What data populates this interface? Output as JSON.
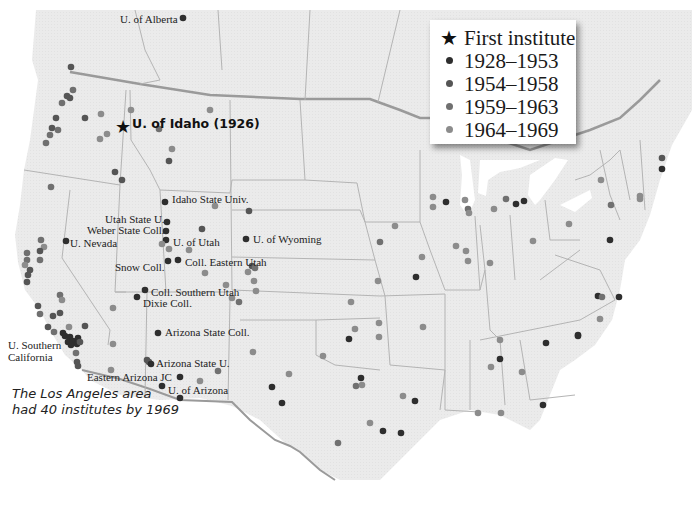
{
  "legend": {
    "items": [
      {
        "symbol": "star-icon",
        "label": "First institute",
        "color": "#111111"
      },
      {
        "symbol": "dot",
        "label": "1928–1953",
        "color": "#2e2e2e"
      },
      {
        "symbol": "dot",
        "label": "1954–1958",
        "color": "#555555"
      },
      {
        "symbol": "dot",
        "label": "1959–1963",
        "color": "#707070"
      },
      {
        "symbol": "dot",
        "label": "1964–1969",
        "color": "#8c8c8c"
      }
    ]
  },
  "first_institute": {
    "label": "U. of Idaho (1926)",
    "x": 122,
    "y": 127
  },
  "annotation": {
    "line1": "The Los Angeles area",
    "line2": "had 40 institutes by 1969"
  },
  "labels": [
    {
      "text": "U. of Alberta",
      "x": 120,
      "y": 13
    },
    {
      "text": "Idaho State Univ.",
      "x": 172,
      "y": 193
    },
    {
      "text": "Utah State U.",
      "x": 105,
      "y": 213
    },
    {
      "text": "Weber State Coll.",
      "x": 87,
      "y": 224
    },
    {
      "text": "U. of Utah",
      "x": 173,
      "y": 236
    },
    {
      "text": "U. Nevada",
      "x": 70,
      "y": 237
    },
    {
      "text": "U. of Wyoming",
      "x": 253,
      "y": 233
    },
    {
      "text": "Coll. Eastern Utah",
      "x": 185,
      "y": 256
    },
    {
      "text": "Snow Coll.",
      "x": 115,
      "y": 261
    },
    {
      "text": "Coll. Southern Utah",
      "x": 151,
      "y": 286
    },
    {
      "text": "Dixie Coll.",
      "x": 143,
      "y": 297
    },
    {
      "text": "Arizona State Coll.",
      "x": 165,
      "y": 326
    },
    {
      "text": "U. Southern",
      "x": 8,
      "y": 339
    },
    {
      "text": "California",
      "x": 8,
      "y": 351
    },
    {
      "text": "Arizona State U.",
      "x": 156,
      "y": 357
    },
    {
      "text": "Eastern Arizona JC",
      "x": 87,
      "y": 371
    },
    {
      "text": "U. of Arizona",
      "x": 168,
      "y": 384
    }
  ],
  "dots": [
    {
      "x": 183,
      "y": 18,
      "p": 1
    },
    {
      "x": 71,
      "y": 67,
      "p": 2
    },
    {
      "x": 73,
      "y": 90,
      "p": 3
    },
    {
      "x": 67,
      "y": 96,
      "p": 2
    },
    {
      "x": 70,
      "y": 98,
      "p": 2
    },
    {
      "x": 62,
      "y": 103,
      "p": 3
    },
    {
      "x": 56,
      "y": 118,
      "p": 2
    },
    {
      "x": 52,
      "y": 128,
      "p": 2
    },
    {
      "x": 58,
      "y": 130,
      "p": 3
    },
    {
      "x": 50,
      "y": 135,
      "p": 3
    },
    {
      "x": 46,
      "y": 143,
      "p": 3
    },
    {
      "x": 85,
      "y": 118,
      "p": 2
    },
    {
      "x": 101,
      "y": 114,
      "p": 4
    },
    {
      "x": 100,
      "y": 139,
      "p": 4
    },
    {
      "x": 107,
      "y": 134,
      "p": 4
    },
    {
      "x": 131,
      "y": 110,
      "p": 4
    },
    {
      "x": 159,
      "y": 129,
      "p": 3
    },
    {
      "x": 210,
      "y": 110,
      "p": 4
    },
    {
      "x": 172,
      "y": 149,
      "p": 4
    },
    {
      "x": 169,
      "y": 161,
      "p": 2
    },
    {
      "x": 115,
      "y": 172,
      "p": 2
    },
    {
      "x": 122,
      "y": 180,
      "p": 2
    },
    {
      "x": 51,
      "y": 187,
      "p": 3
    },
    {
      "x": 165,
      "y": 202,
      "p": 1
    },
    {
      "x": 215,
      "y": 206,
      "p": 4
    },
    {
      "x": 249,
      "y": 211,
      "p": 2
    },
    {
      "x": 167,
      "y": 222,
      "p": 1
    },
    {
      "x": 166,
      "y": 231,
      "p": 1
    },
    {
      "x": 166,
      "y": 240,
      "p": 1
    },
    {
      "x": 202,
      "y": 229,
      "p": 2
    },
    {
      "x": 169,
      "y": 249,
      "p": 4
    },
    {
      "x": 189,
      "y": 250,
      "p": 4
    },
    {
      "x": 246,
      "y": 239,
      "p": 1
    },
    {
      "x": 162,
      "y": 244,
      "p": 4
    },
    {
      "x": 66,
      "y": 241,
      "p": 1
    },
    {
      "x": 41,
      "y": 240,
      "p": 3
    },
    {
      "x": 44,
      "y": 247,
      "p": 4
    },
    {
      "x": 40,
      "y": 251,
      "p": 2
    },
    {
      "x": 27,
      "y": 253,
      "p": 3
    },
    {
      "x": 27,
      "y": 260,
      "p": 3
    },
    {
      "x": 25,
      "y": 265,
      "p": 4
    },
    {
      "x": 30,
      "y": 270,
      "p": 2
    },
    {
      "x": 28,
      "y": 275,
      "p": 2
    },
    {
      "x": 27,
      "y": 282,
      "p": 2
    },
    {
      "x": 40,
      "y": 260,
      "p": 3
    },
    {
      "x": 168,
      "y": 261,
      "p": 1
    },
    {
      "x": 178,
      "y": 260,
      "p": 1
    },
    {
      "x": 252,
      "y": 266,
      "p": 2
    },
    {
      "x": 255,
      "y": 268,
      "p": 3
    },
    {
      "x": 248,
      "y": 272,
      "p": 4
    },
    {
      "x": 205,
      "y": 273,
      "p": 4
    },
    {
      "x": 226,
      "y": 285,
      "p": 4
    },
    {
      "x": 254,
      "y": 281,
      "p": 4
    },
    {
      "x": 256,
      "y": 291,
      "p": 4
    },
    {
      "x": 232,
      "y": 298,
      "p": 4
    },
    {
      "x": 239,
      "y": 302,
      "p": 3
    },
    {
      "x": 145,
      "y": 290,
      "p": 1
    },
    {
      "x": 137,
      "y": 297,
      "p": 1
    },
    {
      "x": 113,
      "y": 308,
      "p": 4
    },
    {
      "x": 60,
      "y": 295,
      "p": 3
    },
    {
      "x": 62,
      "y": 300,
      "p": 4
    },
    {
      "x": 38,
      "y": 306,
      "p": 2
    },
    {
      "x": 40,
      "y": 314,
      "p": 3
    },
    {
      "x": 53,
      "y": 316,
      "p": 2
    },
    {
      "x": 60,
      "y": 313,
      "p": 2
    },
    {
      "x": 48,
      "y": 327,
      "p": 2
    },
    {
      "x": 54,
      "y": 332,
      "p": 3
    },
    {
      "x": 69,
      "y": 327,
      "p": 4
    },
    {
      "x": 85,
      "y": 326,
      "p": 2
    },
    {
      "x": 63,
      "y": 333,
      "p": 1
    },
    {
      "x": 65,
      "y": 336,
      "p": 1
    },
    {
      "x": 70,
      "y": 337,
      "p": 1
    },
    {
      "x": 68,
      "y": 342,
      "p": 1
    },
    {
      "x": 73,
      "y": 341,
      "p": 1
    },
    {
      "x": 78,
      "y": 338,
      "p": 1
    },
    {
      "x": 77,
      "y": 344,
      "p": 1
    },
    {
      "x": 71,
      "y": 345,
      "p": 1
    },
    {
      "x": 80,
      "y": 342,
      "p": 2
    },
    {
      "x": 76,
      "y": 353,
      "p": 3
    },
    {
      "x": 77,
      "y": 362,
      "p": 2
    },
    {
      "x": 78,
      "y": 366,
      "p": 2
    },
    {
      "x": 113,
      "y": 344,
      "p": 4
    },
    {
      "x": 158,
      "y": 333,
      "p": 1
    },
    {
      "x": 147,
      "y": 360,
      "p": 2
    },
    {
      "x": 149,
      "y": 362,
      "p": 2
    },
    {
      "x": 151,
      "y": 364,
      "p": 1
    },
    {
      "x": 180,
      "y": 377,
      "p": 1
    },
    {
      "x": 162,
      "y": 386,
      "p": 1
    },
    {
      "x": 200,
      "y": 381,
      "p": 4
    },
    {
      "x": 111,
      "y": 370,
      "p": 4
    },
    {
      "x": 180,
      "y": 398,
      "p": 1
    },
    {
      "x": 218,
      "y": 371,
      "p": 3
    },
    {
      "x": 253,
      "y": 352,
      "p": 4
    },
    {
      "x": 272,
      "y": 387,
      "p": 1
    },
    {
      "x": 289,
      "y": 374,
      "p": 4
    },
    {
      "x": 282,
      "y": 403,
      "p": 1
    },
    {
      "x": 378,
      "y": 281,
      "p": 4
    },
    {
      "x": 351,
      "y": 302,
      "p": 4
    },
    {
      "x": 355,
      "y": 329,
      "p": 4
    },
    {
      "x": 349,
      "y": 339,
      "p": 1
    },
    {
      "x": 379,
      "y": 337,
      "p": 4
    },
    {
      "x": 323,
      "y": 356,
      "p": 4
    },
    {
      "x": 361,
      "y": 378,
      "p": 1
    },
    {
      "x": 356,
      "y": 386,
      "p": 3
    },
    {
      "x": 362,
      "y": 385,
      "p": 4
    },
    {
      "x": 370,
      "y": 423,
      "p": 4
    },
    {
      "x": 383,
      "y": 431,
      "p": 1
    },
    {
      "x": 338,
      "y": 443,
      "p": 3
    },
    {
      "x": 401,
      "y": 433,
      "p": 1
    },
    {
      "x": 415,
      "y": 401,
      "p": 1
    },
    {
      "x": 403,
      "y": 396,
      "p": 4
    },
    {
      "x": 379,
      "y": 323,
      "p": 4
    },
    {
      "x": 380,
      "y": 242,
      "p": 3
    },
    {
      "x": 422,
      "y": 257,
      "p": 4
    },
    {
      "x": 395,
      "y": 226,
      "p": 4
    },
    {
      "x": 433,
      "y": 207,
      "p": 4
    },
    {
      "x": 446,
      "y": 202,
      "p": 1
    },
    {
      "x": 465,
      "y": 200,
      "p": 4
    },
    {
      "x": 433,
      "y": 197,
      "p": 4
    },
    {
      "x": 468,
      "y": 209,
      "p": 3
    },
    {
      "x": 469,
      "y": 213,
      "p": 4
    },
    {
      "x": 494,
      "y": 209,
      "p": 4
    },
    {
      "x": 506,
      "y": 199,
      "p": 3
    },
    {
      "x": 516,
      "y": 204,
      "p": 1
    },
    {
      "x": 524,
      "y": 201,
      "p": 1
    },
    {
      "x": 456,
      "y": 246,
      "p": 4
    },
    {
      "x": 466,
      "y": 251,
      "p": 4
    },
    {
      "x": 468,
      "y": 261,
      "p": 4
    },
    {
      "x": 490,
      "y": 263,
      "p": 4
    },
    {
      "x": 533,
      "y": 241,
      "p": 4
    },
    {
      "x": 416,
      "y": 277,
      "p": 1
    },
    {
      "x": 569,
      "y": 224,
      "p": 4
    },
    {
      "x": 601,
      "y": 180,
      "p": 4
    },
    {
      "x": 611,
      "y": 205,
      "p": 3
    },
    {
      "x": 662,
      "y": 158,
      "p": 2
    },
    {
      "x": 662,
      "y": 169,
      "p": 1
    },
    {
      "x": 640,
      "y": 199,
      "p": 4
    },
    {
      "x": 610,
      "y": 240,
      "p": 1
    },
    {
      "x": 598,
      "y": 296,
      "p": 1
    },
    {
      "x": 602,
      "y": 297,
      "p": 3
    },
    {
      "x": 619,
      "y": 297,
      "p": 1
    },
    {
      "x": 600,
      "y": 319,
      "p": 4
    },
    {
      "x": 578,
      "y": 335,
      "p": 1
    },
    {
      "x": 546,
      "y": 343,
      "p": 1
    },
    {
      "x": 500,
      "y": 340,
      "p": 4
    },
    {
      "x": 500,
      "y": 359,
      "p": 1
    },
    {
      "x": 491,
      "y": 367,
      "p": 4
    },
    {
      "x": 522,
      "y": 372,
      "p": 4
    },
    {
      "x": 478,
      "y": 413,
      "p": 4
    },
    {
      "x": 501,
      "y": 413,
      "p": 4
    },
    {
      "x": 543,
      "y": 405,
      "p": 1
    },
    {
      "x": 578,
      "y": 336,
      "p": 1
    },
    {
      "x": 640,
      "y": 196,
      "p": 4
    },
    {
      "x": 423,
      "y": 327,
      "p": 4
    }
  ]
}
